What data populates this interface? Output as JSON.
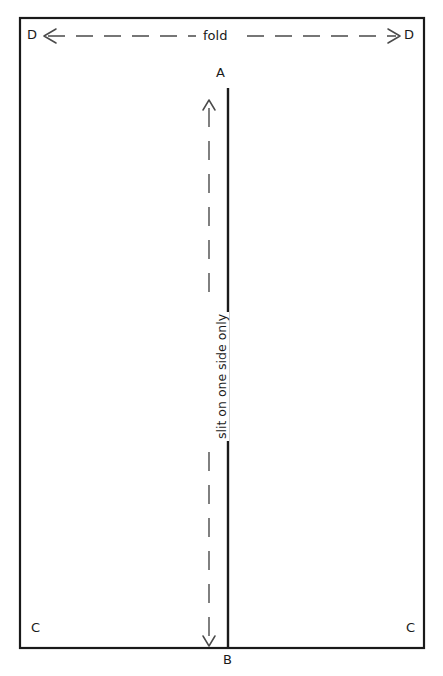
{
  "diagram": {
    "background_color": "#ffffff",
    "line_color": "#1a1a1a",
    "sheet": {
      "name": "paper-sheet-rectangle",
      "x": 20,
      "y": 18,
      "width": 404,
      "height": 630,
      "stroke_width": 2.2
    },
    "corner_labels": [
      {
        "id": "top-left",
        "text": "D",
        "x": 27,
        "y": 28
      },
      {
        "id": "top-right",
        "text": "D",
        "x": 404,
        "y": 28
      },
      {
        "id": "bottom-left",
        "text": "C",
        "x": 31,
        "y": 621
      },
      {
        "id": "bottom-right",
        "text": "C",
        "x": 406,
        "y": 621
      }
    ],
    "vertex_labels": [
      {
        "id": "slit-top",
        "text": "A",
        "x": 216,
        "y": 66
      },
      {
        "id": "slit-bottom",
        "text": "B",
        "x": 223,
        "y": 653
      }
    ],
    "fold_arrow": {
      "name": "fold-double-arrow",
      "label": "fold",
      "label_x": 221,
      "label_y": 29,
      "y": 36,
      "x_start": 44,
      "x_end": 400,
      "dash_pattern": "17 11",
      "stroke_width": 1.4
    },
    "slit_line": {
      "name": "slit-solid-line",
      "x": 228,
      "y_start": 88,
      "y_end": 648,
      "stroke_width": 2.4
    },
    "slit_arrow": {
      "name": "slit-double-arrow",
      "label": "slit on one side only",
      "label_x": 213,
      "label_y": 440,
      "x": 209,
      "y_start": 100,
      "y_end": 646,
      "dash_pattern": "19 14",
      "stroke_width": 1.4
    }
  }
}
